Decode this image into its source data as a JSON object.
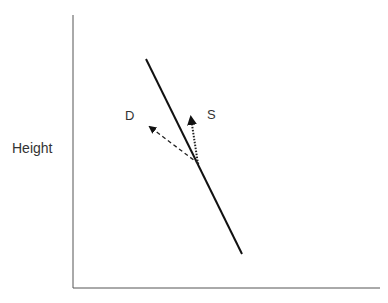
{
  "diagram": {
    "y_axis_label": "Height",
    "vectors": [
      {
        "label": "D",
        "style": "dashed"
      },
      {
        "label": "S",
        "style": "dotted"
      }
    ],
    "colors": {
      "line": "#111111",
      "text": "#333333",
      "axis": "#444444"
    }
  }
}
